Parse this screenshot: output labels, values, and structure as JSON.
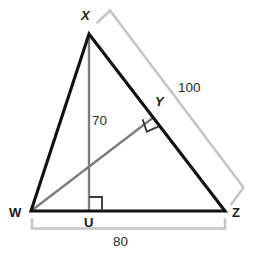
{
  "figure": {
    "colors": {
      "triangle_stroke": "#111111",
      "inner_segment_stroke": "#7d7d7d",
      "bracket_stroke": "#c6c6c6",
      "right_angle_stroke": "#3a3a3a",
      "label_text": "#1a1a1a",
      "background": "#ffffff"
    },
    "vertices": [
      {
        "name": "X",
        "label": "X",
        "style": "italic",
        "x": 89,
        "y": 34,
        "label_x": 81,
        "label_y": 9
      },
      {
        "name": "Y",
        "label": "Y",
        "style": "italic",
        "x": 153,
        "y": 117,
        "label_x": 155,
        "label_y": 95
      },
      {
        "name": "W",
        "label": "W",
        "style": "plain",
        "x": 31,
        "y": 211,
        "label_x": 10,
        "label_y": 207
      },
      {
        "name": "U",
        "label": "U",
        "style": "plain",
        "x": 89,
        "y": 211,
        "label_x": 84,
        "label_y": 216
      },
      {
        "name": "Z",
        "label": "Z",
        "style": "plain",
        "x": 225,
        "y": 211,
        "label_x": 231,
        "label_y": 207
      }
    ],
    "measures": [
      {
        "name": "altitude-length",
        "value": "70",
        "label_x": 89,
        "label_y": 114
      },
      {
        "name": "side-xz-length",
        "value": "100",
        "label_x": 178,
        "label_y": 81
      },
      {
        "name": "side-wz-length",
        "value": "80",
        "label_x": 113,
        "label_y": 235
      }
    ],
    "segments": [
      {
        "name": "side-wx",
        "from": "W",
        "to": "X",
        "kind": "triangle-side"
      },
      {
        "name": "side-xz",
        "from": "X",
        "to": "Z",
        "kind": "triangle-side"
      },
      {
        "name": "side-wz",
        "from": "W",
        "to": "Z",
        "kind": "triangle-side"
      },
      {
        "name": "altitude-xu",
        "from": "X",
        "to": "U",
        "kind": "inner-segment"
      },
      {
        "name": "segment-wy",
        "from": "W",
        "to": "Y",
        "kind": "inner-segment"
      }
    ],
    "right_angles": [
      {
        "name": "right-angle-at-u",
        "at": "U"
      },
      {
        "name": "right-angle-at-y",
        "at": "Y"
      }
    ],
    "brackets": [
      {
        "name": "bracket-xz",
        "measure": "100"
      },
      {
        "name": "bracket-wz",
        "measure": "80"
      }
    ]
  }
}
